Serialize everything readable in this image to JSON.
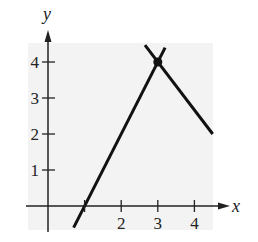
{
  "chart_data": {
    "type": "line",
    "title": "",
    "xlabel": "x",
    "ylabel": "y",
    "xlim": [
      -1.3,
      4.6
    ],
    "ylim": [
      -0.7,
      4.5
    ],
    "x_ticks": [
      2,
      3,
      4
    ],
    "y_ticks": [
      1,
      2,
      3,
      4
    ],
    "grid": false,
    "background": "#f3f3f3",
    "series": [
      {
        "name": "line-increasing",
        "equation": "y = 2x - 2",
        "x": [
          0.7,
          3.2
        ],
        "y": [
          -0.6,
          4.4
        ],
        "color": "#111111"
      },
      {
        "name": "line-decreasing",
        "equation": "y = -4/3 x + 8",
        "x": [
          2.65,
          4.5
        ],
        "y": [
          4.47,
          2.0
        ],
        "color": "#111111"
      }
    ],
    "points": [
      {
        "label": "intersection",
        "x": 3,
        "y": 4
      }
    ]
  },
  "axes": {
    "x_label": "x",
    "y_label": "y",
    "x_tick_labels": [
      "2",
      "3",
      "4"
    ],
    "y_tick_labels": [
      "1",
      "2",
      "3",
      "4"
    ]
  }
}
